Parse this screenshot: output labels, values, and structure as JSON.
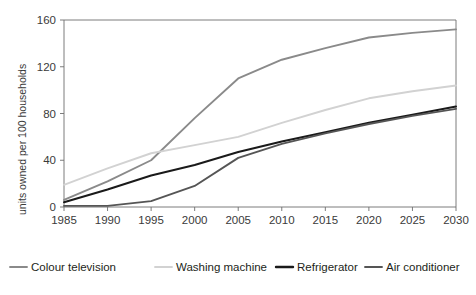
{
  "chart_data": {
    "type": "line",
    "title": "",
    "subtitle": "",
    "xlabel": "",
    "ylabel": "units owned per 100 households",
    "x": [
      1985,
      1990,
      1995,
      2000,
      2005,
      2010,
      2015,
      2020,
      2025,
      2030
    ],
    "xlim": [
      1985,
      2030
    ],
    "ylim": [
      0,
      160
    ],
    "yticks": [
      0,
      40,
      80,
      120,
      160
    ],
    "xticks": [
      "1985",
      "1990",
      "1995",
      "2000",
      "2005",
      "2010",
      "2015",
      "2020",
      "2025",
      "2030"
    ],
    "ytick_labels": [
      "0",
      "40",
      "80",
      "120",
      "160"
    ],
    "grid": false,
    "legend_position": "bottom",
    "series": [
      {
        "name": "Colour television",
        "color": "#8a8a8a",
        "width": 1.9,
        "values": [
          6,
          22,
          40,
          76,
          110,
          126,
          136,
          145,
          149,
          152
        ]
      },
      {
        "name": "Washing machine",
        "color": "#d2d2d2",
        "width": 1.9,
        "values": [
          19,
          33,
          46,
          53,
          60,
          72,
          83,
          93,
          99,
          104
        ]
      },
      {
        "name": "Refrigerator",
        "color": "#1a1a1a",
        "width": 2.0,
        "values": [
          4,
          15,
          27,
          36,
          47,
          56,
          64,
          72,
          79,
          86
        ]
      },
      {
        "name": "Air conditioner",
        "color": "#555555",
        "width": 1.9,
        "values": [
          1,
          1,
          5,
          18,
          42,
          54,
          63,
          71,
          78,
          84
        ]
      }
    ]
  },
  "legend": {
    "items": [
      {
        "label": "Colour television",
        "color": "#8a8a8a",
        "swatch": "line-swatch"
      },
      {
        "label": "Washing machine",
        "color": "#d2d2d2",
        "swatch": "line-swatch"
      },
      {
        "label": "Refrigerator",
        "color": "#1a1a1a",
        "swatch": "line-swatch"
      },
      {
        "label": "Air conditioner",
        "color": "#555555",
        "swatch": "line-swatch"
      }
    ]
  },
  "axes": {
    "frame_color": "#6e6e6e",
    "text_color": "#3a3a3a"
  }
}
